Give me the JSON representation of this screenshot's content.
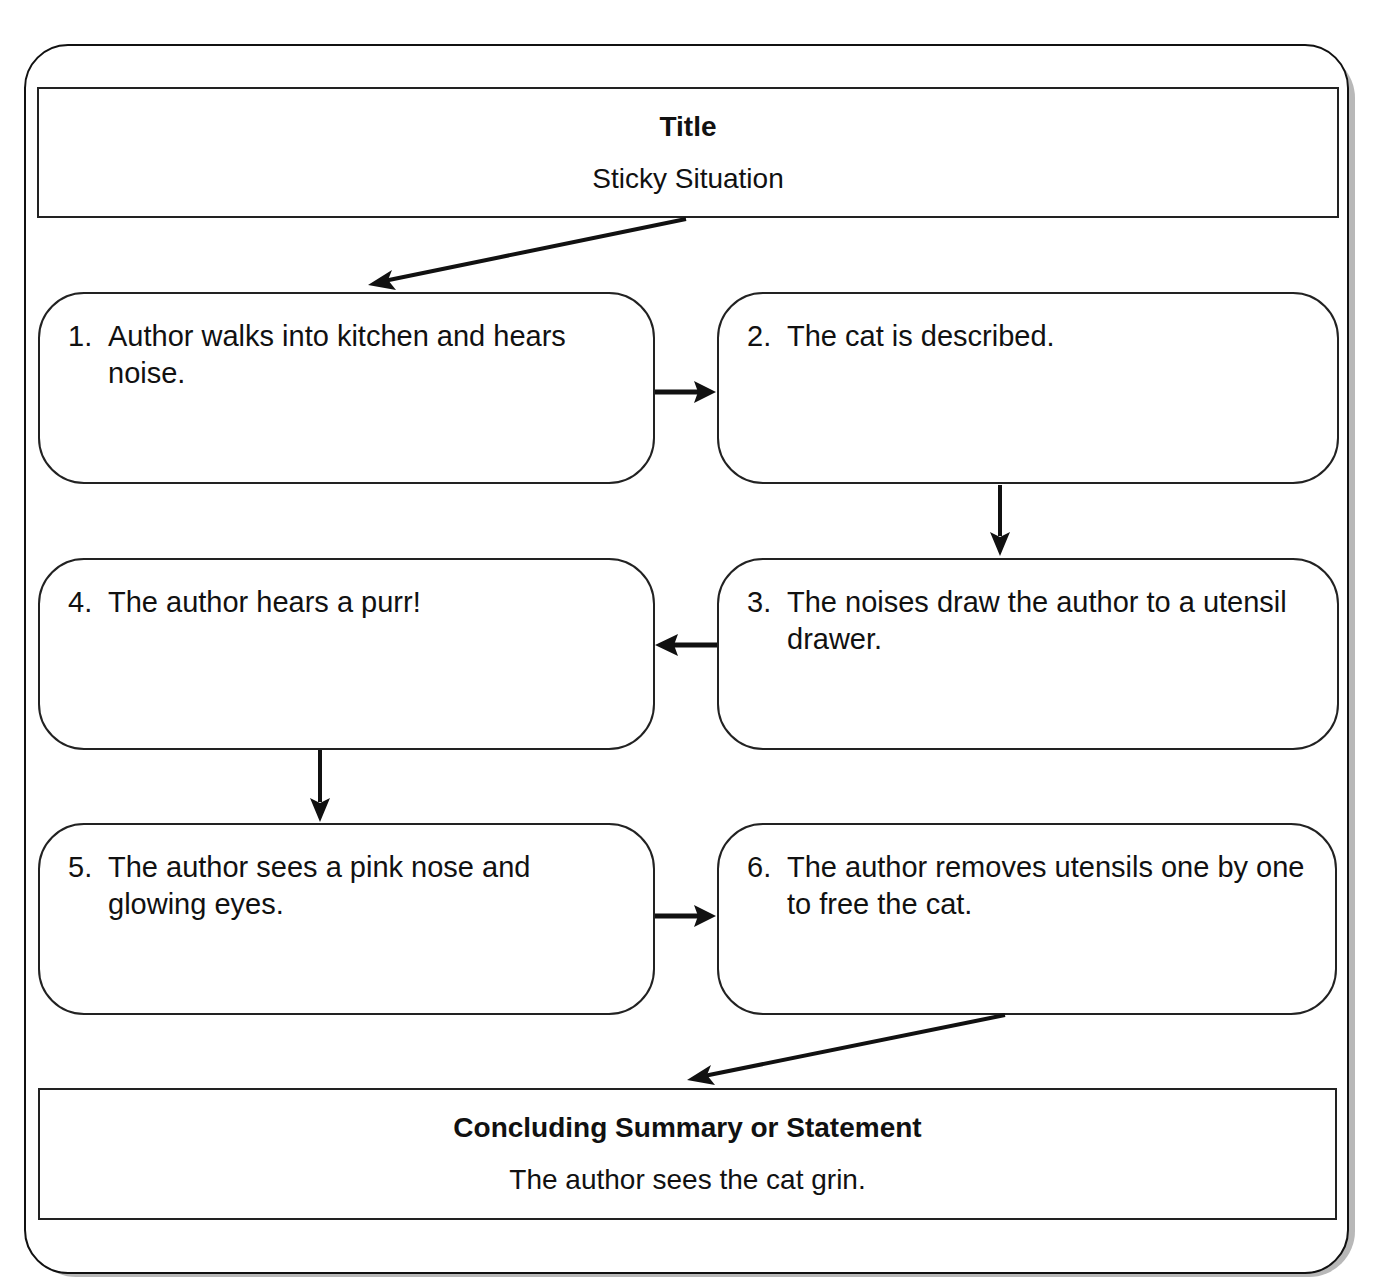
{
  "header": {
    "title_box": {
      "heading": "Title",
      "value": "Sticky Situation"
    }
  },
  "steps": [
    {
      "number": "1.",
      "text": "Author walks into kitchen and hears noise."
    },
    {
      "number": "2.",
      "text": "The cat is described."
    },
    {
      "number": "3.",
      "text": "The noises draw the author to a utensil drawer."
    },
    {
      "number": "4.",
      "text": "The author hears a purr!"
    },
    {
      "number": "5.",
      "text": "The author sees a pink nose and glowing eyes."
    },
    {
      "number": "6.",
      "text": "The author removes utensils one by one to free the cat."
    }
  ],
  "footer": {
    "conclusion_box": {
      "heading": "Concluding Summary or Statement",
      "value": "The author sees the cat grin."
    }
  },
  "flow": [
    "title → 1",
    "1 → 2",
    "2 → 3",
    "3 → 4",
    "4 → 5",
    "5 → 6",
    "6 → conclusion"
  ]
}
